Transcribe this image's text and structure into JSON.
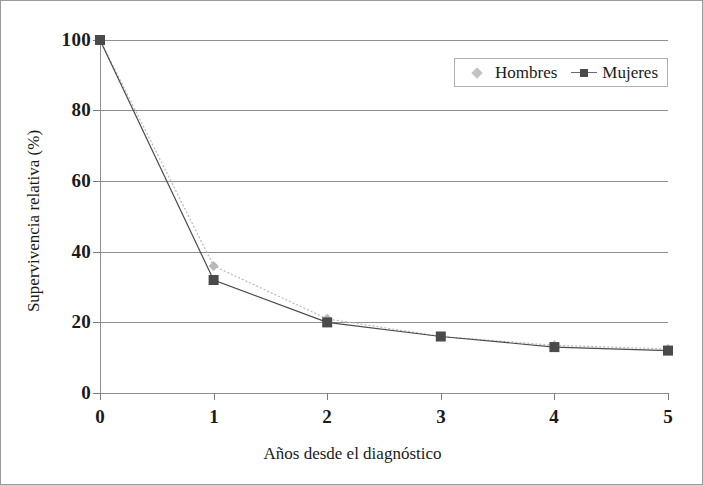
{
  "chart_data": {
    "type": "line",
    "title": "",
    "subtitle": "",
    "xlabel": "Años desde el diagnóstico",
    "ylabel": "Supervivencia relativa (%)",
    "x": [
      0,
      1,
      2,
      3,
      4,
      5
    ],
    "xtick_labels": [
      "0",
      "1",
      "2",
      "3",
      "4",
      "5"
    ],
    "ytick_labels": [
      "0",
      "20",
      "40",
      "60",
      "80",
      "100"
    ],
    "ytick_values": [
      0,
      20,
      40,
      60,
      80,
      100
    ],
    "xlim": [
      0,
      5
    ],
    "ylim": [
      0,
      100
    ],
    "grid": "horizontal",
    "legend_position": "top-right",
    "series": [
      {
        "name": "Hombres",
        "values": [
          100,
          36,
          21,
          16,
          13.5,
          12.5
        ],
        "color": "#b8b8b8",
        "marker": "diamond",
        "line_style": "dotted"
      },
      {
        "name": "Mujeres",
        "values": [
          100,
          32,
          20,
          16,
          13,
          12
        ],
        "color": "#4a4a4a",
        "marker": "square",
        "line_style": "solid"
      }
    ]
  },
  "axes": {
    "y_ticks": [
      {
        "label": "100",
        "value": 100
      },
      {
        "label": "80",
        "value": 80
      },
      {
        "label": "60",
        "value": 60
      },
      {
        "label": "40",
        "value": 40
      },
      {
        "label": "20",
        "value": 20
      },
      {
        "label": "0",
        "value": 0
      }
    ],
    "x_ticks": [
      {
        "label": "0",
        "value": 0
      },
      {
        "label": "1",
        "value": 1
      },
      {
        "label": "2",
        "value": 2
      },
      {
        "label": "3",
        "value": 3
      },
      {
        "label": "4",
        "value": 4
      },
      {
        "label": "5",
        "value": 5
      }
    ]
  },
  "legend": {
    "entries": [
      {
        "label": "Hombres",
        "marker": "diamond-marker",
        "color": "#b8b8b8"
      },
      {
        "label": "Mujeres",
        "marker": "square-marker",
        "color": "#4a4a4a"
      }
    ]
  },
  "colors": {
    "hombres": "#b8b8b8",
    "mujeres": "#4a4a4a",
    "gridline": "#8f8f8f",
    "axis": "#7b7b7b",
    "text": "#1a1a1a",
    "border": "#9a9a9a",
    "background": "#ffffff"
  }
}
